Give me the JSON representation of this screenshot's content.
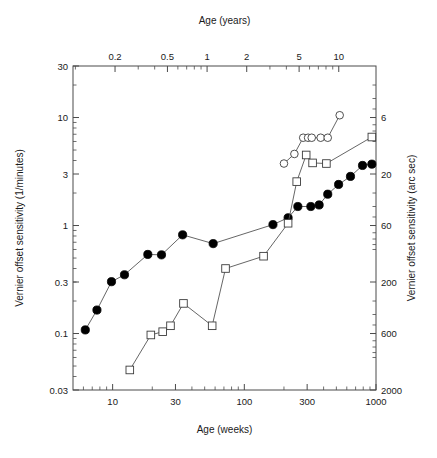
{
  "figure": {
    "name": "vernier-offset-sensitivity-development-figure",
    "background": "#ffffff"
  },
  "chart_data": {
    "type": "line",
    "title": "",
    "subtitle": "",
    "xlabel": "Age (weeks)",
    "ylabel": "Vernier offset sensitivity (1/minutes)",
    "x_top_label": "Age (years)",
    "y_right_label": "Vernier offset sensitivity (arc sec)",
    "xscale": "log",
    "yscale": "log",
    "xlim": [
      5,
      1000
    ],
    "ylim": [
      0.03,
      30
    ],
    "grid": false,
    "legend": "none",
    "x_ticks": [
      10,
      30,
      100,
      300,
      1000
    ],
    "x_tick_labels": [
      "10",
      "30",
      "100",
      "300",
      "1000"
    ],
    "x_top_ticks": [
      0.2,
      0.5,
      1,
      2,
      5,
      10,
      20
    ],
    "x_top_tick_labels": [
      "0.2",
      "0.5",
      "1",
      "2",
      "5",
      "10",
      "20"
    ],
    "y_ticks": [
      0.03,
      0.1,
      0.3,
      1,
      3,
      10,
      30
    ],
    "y_tick_labels": [
      "0.03",
      "0.1",
      "0.3",
      "1",
      "3",
      "10",
      "30"
    ],
    "y_right_ticks": [
      6,
      20,
      60,
      200,
      600,
      2000
    ],
    "y_right_tick_labels": [
      "6",
      "20",
      "60",
      "200",
      "600",
      "2000"
    ],
    "series": [
      {
        "name": "filled-circles",
        "marker": "filled-circle",
        "color": "#000000",
        "x": [
          6.2,
          7.6,
          9.8,
          12.3,
          18.5,
          23.5,
          34,
          58,
          165,
          215,
          255,
          320,
          370,
          430,
          520,
          640,
          790,
          930
        ],
        "y": [
          0.108,
          0.165,
          0.302,
          0.35,
          0.54,
          0.535,
          0.82,
          0.68,
          1.02,
          1.18,
          1.5,
          1.5,
          1.55,
          1.95,
          2.4,
          2.85,
          3.6,
          3.7
        ]
      },
      {
        "name": "open-squares",
        "marker": "open-square",
        "color": "#3c3c3c",
        "x": [
          13.5,
          19.5,
          24,
          27.5,
          34.5,
          57,
          72,
          140,
          215,
          250,
          295,
          330,
          420,
          930
        ],
        "y": [
          0.046,
          0.097,
          0.104,
          0.118,
          0.19,
          0.118,
          0.4,
          0.52,
          1.05,
          2.55,
          4.5,
          3.8,
          3.75,
          6.6
        ]
      },
      {
        "name": "open-circles",
        "marker": "open-circle",
        "color": "#3c3c3c",
        "x": [
          200,
          240,
          280,
          305,
          325,
          380,
          430,
          530
        ],
        "y": [
          3.75,
          4.6,
          6.5,
          6.5,
          6.5,
          6.5,
          6.5,
          10.5
        ]
      }
    ]
  }
}
